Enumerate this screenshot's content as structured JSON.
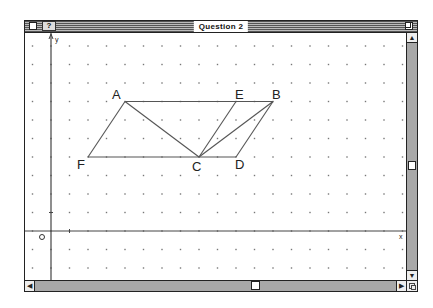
{
  "window": {
    "title": "Question 2",
    "help_label": "?",
    "scroll_arrow_up": "▲",
    "scroll_arrow_down": "▼",
    "scroll_arrow_left": "◀",
    "scroll_arrow_right": "▶"
  },
  "axes": {
    "y_label": "y",
    "x_label": "x",
    "origin_label": "O"
  },
  "geometry": {
    "grid_spacing_px": 18.5,
    "points": [
      {
        "name": "A",
        "x": 4,
        "y": 7
      },
      {
        "name": "E",
        "x": 10,
        "y": 7
      },
      {
        "name": "B",
        "x": 12,
        "y": 7
      },
      {
        "name": "F",
        "x": 2,
        "y": 4
      },
      {
        "name": "C",
        "x": 8,
        "y": 4
      },
      {
        "name": "D",
        "x": 10,
        "y": 4
      }
    ],
    "segments": [
      [
        "A",
        "B"
      ],
      [
        "F",
        "D"
      ],
      [
        "A",
        "F"
      ],
      [
        "A",
        "C"
      ],
      [
        "C",
        "E"
      ],
      [
        "C",
        "B"
      ],
      [
        "B",
        "D"
      ]
    ],
    "labels": {
      "A": "A",
      "B": "B",
      "C": "C",
      "D": "D",
      "E": "E",
      "F": "F"
    }
  },
  "colors": {
    "line": "#555555",
    "grid_dot": "#777777",
    "axis": "#444444",
    "scroll_track": "#a8a8a8"
  }
}
